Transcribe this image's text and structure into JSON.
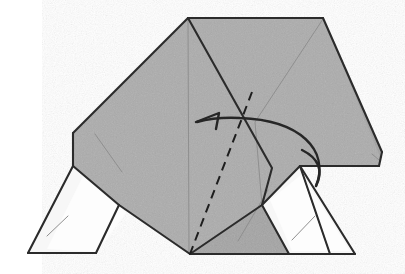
{
  "figure": {
    "canvas": {
      "width": 405,
      "height": 274,
      "background": "#ffffff"
    }
  },
  "colors": {
    "paper_front_gray": "#a9a9a9",
    "paper_back_white": "#fbfbfb",
    "paper_shadow_gray": "#9a9a9a",
    "edge_outline": "#2b2b2b",
    "crease_thin": "#8a8a8a",
    "fold_dashed": "#1e1e1e",
    "arrow_stroke": "#262626"
  },
  "shapes": {
    "body_main": {
      "name": "main-gray-body-panel",
      "fill": "paper_front_gray",
      "points": "188,18 323,18 379,154 379,166 300,166 262,205 190,254 119,205 73,166 73,133"
    },
    "right_wing": {
      "name": "right-gray-wing-panel",
      "fill": "paper_front_gray",
      "points": "323,18 382,152 379,166 300,166 262,205 272,168 255,120"
    },
    "left_leg": {
      "name": "left-white-leg",
      "fill": "paper_back_white",
      "points": "73,166 119,205 96,253 28,253"
    },
    "left_leg_inner": {
      "name": "left-leg-inner-flap",
      "fill": "paper_back_white",
      "points": "83,176 126,213 97,252 47,249"
    },
    "right_leg": {
      "name": "right-white-leg",
      "fill": "paper_back_white",
      "points": "262,205 300,166 355,254 289,254"
    },
    "right_leg_inner": {
      "name": "right-leg-inner-flap",
      "fill": "paper_back_white",
      "points": "270,200 302,174 350,251 292,251"
    },
    "center_lower_gray": {
      "name": "center-lower-gray-panel",
      "fill": "paper_front_gray",
      "points": "190,254 262,205 300,166 310,196 330,254"
    }
  },
  "edges": [
    {
      "name": "top-edge",
      "d": "M188,18 L323,18",
      "kind": "outline"
    },
    {
      "name": "left-upper-edge",
      "d": "M188,18 L73,133",
      "kind": "outline"
    },
    {
      "name": "left-vertical-edge",
      "d": "M73,133 L73,166",
      "kind": "outline"
    },
    {
      "name": "right-upper-edge",
      "d": "M323,18 L382,152",
      "kind": "outline"
    },
    {
      "name": "right-lower-edge",
      "d": "M382,152 L379,166",
      "kind": "outline"
    },
    {
      "name": "right-fold-edge",
      "d": "M379,166 L300,166",
      "kind": "outline"
    },
    {
      "name": "center-diagonal-fold",
      "d": "M188,18 L272,168 L262,205",
      "kind": "fold"
    },
    {
      "name": "left-leg-top-edge",
      "d": "M73,166 L119,205",
      "kind": "outline"
    },
    {
      "name": "left-leg-outer-edge",
      "d": "M119,205 L96,253",
      "kind": "outline"
    },
    {
      "name": "left-leg-bottom-edge",
      "d": "M96,253 L28,253",
      "kind": "outline"
    },
    {
      "name": "left-leg-inner-edge",
      "d": "M28,253 L73,166",
      "kind": "outline"
    },
    {
      "name": "left-body-to-center",
      "d": "M119,205 L190,254",
      "kind": "outline"
    },
    {
      "name": "center-to-right-leg",
      "d": "M190,254 L262,205",
      "kind": "outline"
    },
    {
      "name": "right-leg-upper-edge",
      "d": "M262,205 L300,166",
      "kind": "outline"
    },
    {
      "name": "right-leg-outer-edge",
      "d": "M300,166 L355,254",
      "kind": "outline"
    },
    {
      "name": "right-leg-bottom-edge",
      "d": "M355,254 L289,254",
      "kind": "outline"
    },
    {
      "name": "right-leg-inner-edge",
      "d": "M289,254 L262,205",
      "kind": "outline"
    },
    {
      "name": "center-lower-bottom-edge",
      "d": "M190,254 L330,254",
      "kind": "outline"
    },
    {
      "name": "right-panel-lower-edge",
      "d": "M330,254 L300,166",
      "kind": "fold"
    }
  ],
  "creases": [
    {
      "name": "center-vertical-crease",
      "d": "M188,19 L189,253"
    },
    {
      "name": "right-thin-diagonal-crease",
      "d": "M323,19 L255,122 L262,205"
    },
    {
      "name": "right-thin-crease-lower",
      "d": "M300,166 L310,196 L330,254"
    },
    {
      "name": "left-short-crease",
      "d": "M95,134 L122,172"
    },
    {
      "name": "left-leg-crease",
      "d": "M47,236 L68,216"
    },
    {
      "name": "right-leg-crease",
      "d": "M292,240 L315,216"
    },
    {
      "name": "lower-center-thin-crease",
      "d": "M238,241 L268,190"
    },
    {
      "name": "right-edge-thin-crease",
      "d": "M379,160 L372,154"
    }
  ],
  "fold_line": {
    "name": "valley-fold-dashed-line",
    "d": "M252,92 L190,254",
    "dash_pattern": "9,6",
    "label": "valley fold"
  },
  "arrow": {
    "name": "fold-action-arrow",
    "direction": "right-to-left-curving",
    "curve_d": "M316,186 C330,150 300,120 240,118 C222,117 208,119 197,122",
    "head_points": "196,122 219,113 216,129",
    "tail_curl_d": "M316,186 C324,170 318,158 302,150",
    "label": "fold this flap to the left"
  }
}
